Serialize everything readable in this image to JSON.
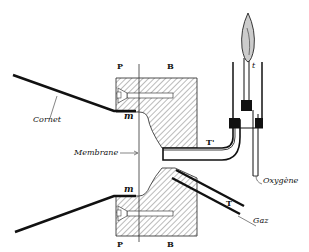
{
  "diagram": {
    "labels": {
      "cornet": "Cornet",
      "membrane": "Membrane",
      "oxygene": "Oxygène",
      "gaz": "Gaz",
      "p_top": "P",
      "b_top": "B",
      "p_bottom": "P",
      "b_bottom": "B",
      "m_top": "m",
      "m_bottom": "m",
      "t_prime": "T'",
      "t": "T",
      "t_small": "t"
    },
    "colors": {
      "ink": "#111111",
      "background": "#ffffff"
    }
  }
}
